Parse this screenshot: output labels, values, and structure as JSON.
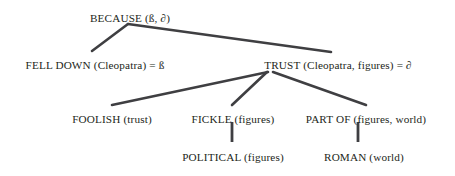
{
  "diagram": {
    "background_color": "#ffffff",
    "edge_color": "#3f3f42",
    "text_color": "#231f20",
    "nodes": [
      {
        "id": "because",
        "level": 0,
        "predicate": "BECAUSE",
        "arguments": "(ß, ∂)",
        "label": "BECAUSE (ß, ∂)",
        "x": 130,
        "y": 12
      },
      {
        "id": "fell-down",
        "level": 1,
        "predicate": "FELL DOWN",
        "arguments": "(Cleopatra)",
        "binding": "= ß",
        "label": "FELL DOWN (Cleopatra) = ß",
        "x": 95,
        "y": 59
      },
      {
        "id": "trust",
        "level": 1,
        "predicate": "TRUST",
        "arguments": "(Cleopatra, figures)",
        "binding": "= ∂",
        "label": "TRUST (Cleopatra, figures) = ∂",
        "x": 338,
        "y": 59
      },
      {
        "id": "foolish",
        "level": 2,
        "predicate": "FOOLISH",
        "arguments": "(trust)",
        "label": "FOOLISH (trust)",
        "x": 112,
        "y": 113
      },
      {
        "id": "fickle",
        "level": 2,
        "predicate": "FICKLE",
        "arguments": "(figures)",
        "label": "FICKLE (figures)",
        "x": 233,
        "y": 113
      },
      {
        "id": "part-of",
        "level": 2,
        "predicate": "PART OF",
        "arguments": "(figures, world)",
        "label": "PART OF (figures, world)",
        "x": 366,
        "y": 113
      },
      {
        "id": "political",
        "level": 3,
        "predicate": "POLITICAL",
        "arguments": "(figures)",
        "label": "POLITICAL (figures)",
        "x": 233,
        "y": 151
      },
      {
        "id": "roman",
        "level": 3,
        "predicate": "ROMAN",
        "arguments": "(world)",
        "label": "ROMAN (world)",
        "x": 364,
        "y": 151
      }
    ],
    "edges": [
      {
        "id": "because-to-fell-down",
        "from": "because",
        "to": "fell-down",
        "x1": 128,
        "y1": 24,
        "x2": 92,
        "y2": 51
      },
      {
        "id": "because-to-trust",
        "from": "because",
        "to": "trust",
        "x1": 128,
        "y1": 24,
        "x2": 331,
        "y2": 52
      },
      {
        "id": "trust-to-foolish",
        "from": "trust",
        "to": "foolish",
        "x1": 268,
        "y1": 72,
        "x2": 112,
        "y2": 105
      },
      {
        "id": "trust-to-fickle",
        "from": "trust",
        "to": "fickle",
        "x1": 267,
        "y1": 72,
        "x2": 232,
        "y2": 105
      },
      {
        "id": "trust-to-part-of",
        "from": "trust",
        "to": "part-of",
        "x1": 273,
        "y1": 72,
        "x2": 366,
        "y2": 105
      },
      {
        "id": "fickle-to-political",
        "from": "fickle",
        "to": "political",
        "x1": 232,
        "y1": 122,
        "x2": 232,
        "y2": 142
      },
      {
        "id": "part-of-to-roman",
        "from": "part-of",
        "to": "roman",
        "x1": 358,
        "y1": 122,
        "x2": 358,
        "y2": 142
      }
    ]
  }
}
